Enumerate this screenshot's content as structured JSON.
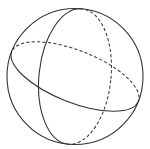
{
  "diagram": {
    "type": "sphere-wireframe",
    "colors": {
      "stroke": "#333333",
      "background": "#ffffff"
    },
    "sphere": {
      "cx": 75,
      "cy": 76.5,
      "r": 68
    },
    "circles": [
      {
        "name": "horizontal-great-circle",
        "rx": 68,
        "ry": 26,
        "rotation": 21.5
      },
      {
        "name": "vertical-great-circle",
        "rx": 36,
        "ry": 68,
        "rotation": 6
      }
    ]
  }
}
